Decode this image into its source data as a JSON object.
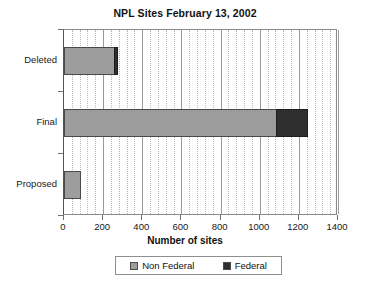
{
  "chart_data": {
    "type": "bar",
    "orientation": "horizontal",
    "stacked": true,
    "title": "NPL Sites February 13, 2002",
    "xlabel": "Number of sites",
    "ylabel": "",
    "categories": [
      "Deleted",
      "Final",
      "Proposed"
    ],
    "series": [
      {
        "name": "Non Federal",
        "color": "#9d9d9d",
        "values": [
          255,
          1081,
          87
        ]
      },
      {
        "name": "Federal",
        "color": "#2f2f2f",
        "values": [
          20,
          164,
          0
        ]
      }
    ],
    "totals": [
      275,
      1245,
      87
    ],
    "xlim": [
      0,
      1400
    ],
    "xticks": [
      0,
      200,
      400,
      600,
      800,
      1000,
      1200,
      1400
    ],
    "xtick_labels": [
      "0",
      "200",
      "400",
      "600",
      "800",
      "1000",
      "1200",
      "1400"
    ],
    "minor_gridlines_per_interval": 4,
    "grid": true,
    "grid_axis": "x",
    "legend_position": "bottom",
    "legend_entries": [
      "Non Federal",
      "Federal"
    ]
  }
}
